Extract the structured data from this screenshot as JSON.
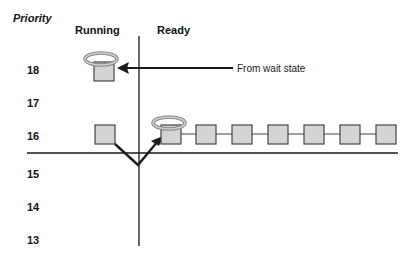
{
  "diagram": {
    "axis_title": "Priority",
    "columns": {
      "running": "Running",
      "ready": "Ready"
    },
    "priority_levels": [
      "18",
      "17",
      "16",
      "15",
      "14",
      "13"
    ],
    "annotation": "From wait state",
    "colors": {
      "box_fill": "#d4d4d4",
      "box_stroke": "#444444",
      "line": "#1a1a1a"
    },
    "running_threads": [
      {
        "priority": 18,
        "halo": true,
        "note": "arrived from wait state"
      },
      {
        "priority": 16,
        "halo": false,
        "note": "preempted, moved to ready queue head"
      }
    ],
    "ready_queue": {
      "priority": 16,
      "count": 7,
      "first_has_halo": true
    }
  }
}
